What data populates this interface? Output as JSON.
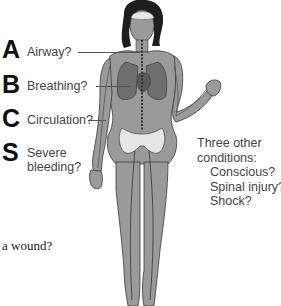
{
  "abcs": [
    {
      "letter": "A",
      "label": "Airway?"
    },
    {
      "letter": "B",
      "label": "Breathing?"
    },
    {
      "letter": "C",
      "label": "Circulation?"
    },
    {
      "letter": "S",
      "label_line1": "Severe",
      "label_line2": "bleeding?"
    }
  ],
  "other_conditions": {
    "heading_line1": "Three other",
    "heading_line2": "conditions:",
    "items": [
      "Conscious?",
      "Spinal injury?",
      "Shock?"
    ]
  },
  "fragment_text": "a wound?",
  "colors": {
    "body_fill": "#9a9a9a",
    "outline": "#3a3a3a",
    "organ_fill": "#6e6e6e",
    "bone_fill": "#e6e6e6",
    "hair": "#1e1e1e",
    "letter": "#111111",
    "label": "#444444"
  }
}
